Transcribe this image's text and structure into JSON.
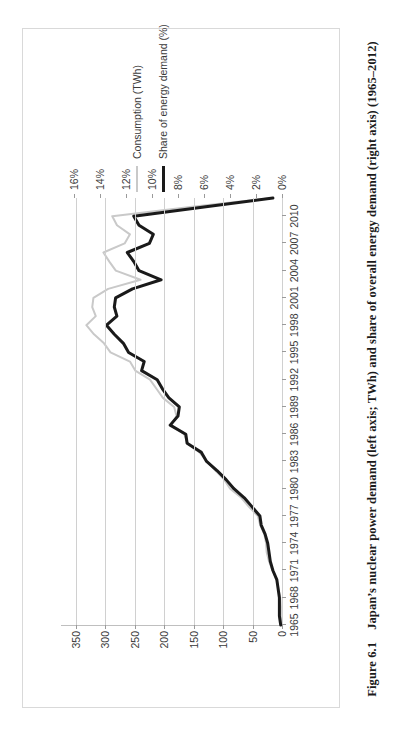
{
  "figure": {
    "number": "Figure 6.1",
    "caption": "Japan’s nuclear power demand (left axis; TWh) and share of overall energy demand (right axis) (1965–2012)"
  },
  "legend": {
    "position": "right",
    "items": [
      {
        "label": "Consumption (TWh)",
        "color": "#c9c9c9",
        "axis": "left"
      },
      {
        "label": "Share of energy demand (%)",
        "color": "#1a1a1a",
        "axis": "right"
      }
    ]
  },
  "chart_data": {
    "type": "line",
    "title": "",
    "subtitle": "",
    "xlabel": "",
    "ylabel": "",
    "grid": true,
    "rotation_deg": -90,
    "x": [
      1965,
      1966,
      1967,
      1968,
      1969,
      1970,
      1971,
      1972,
      1973,
      1974,
      1975,
      1976,
      1977,
      1978,
      1979,
      1980,
      1981,
      1982,
      1983,
      1984,
      1985,
      1986,
      1987,
      1988,
      1989,
      1990,
      1991,
      1992,
      1993,
      1994,
      1995,
      1996,
      1997,
      1998,
      1999,
      2000,
      2001,
      2002,
      2003,
      2004,
      2005,
      2006,
      2007,
      2008,
      2009,
      2010,
      2011,
      2012
    ],
    "xtick_labels": [
      "1965",
      "1968",
      "1971",
      "1974",
      "1977",
      "1980",
      "1983",
      "1986",
      "1989",
      "1992",
      "1995",
      "1998",
      "2001",
      "2004",
      "2007",
      "2010"
    ],
    "xtick_values": [
      1965,
      1968,
      1971,
      1974,
      1977,
      1980,
      1983,
      1986,
      1989,
      1992,
      1995,
      1998,
      2001,
      2004,
      2007,
      2010
    ],
    "left_axis": {
      "label": "Consumption (TWh)",
      "ticks": [
        0,
        50,
        100,
        150,
        200,
        250,
        300,
        350
      ],
      "tick_labels": [
        "0",
        "50",
        "100",
        "150",
        "200",
        "250",
        "300",
        "350"
      ],
      "ylim": [
        0,
        375
      ]
    },
    "right_axis": {
      "label": "Share of energy demand (%)",
      "ticks": [
        0,
        2,
        4,
        6,
        8,
        10,
        12,
        14,
        16
      ],
      "tick_labels": [
        "0%",
        "2%",
        "4%",
        "6%",
        "8%",
        "10%",
        "12%",
        "14%",
        "16%"
      ],
      "ylim": [
        0,
        17
      ]
    },
    "series": [
      {
        "name": "Consumption (TWh)",
        "axis": "left",
        "color": "#c9c9c9",
        "width": 2,
        "values": [
          1,
          2,
          2,
          3,
          6,
          9,
          16,
          22,
          26,
          27,
          30,
          37,
          41,
          56,
          69,
          88,
          98,
          113,
          127,
          140,
          160,
          166,
          188,
          179,
          183,
          202,
          213,
          224,
          249,
          258,
          291,
          302,
          319,
          332,
          316,
          322,
          320,
          295,
          240,
          282,
          293,
          303,
          267,
          258,
          280,
          288,
          156,
          17
        ]
      },
      {
        "name": "Share of energy demand (%)",
        "axis": "right",
        "color": "#1a1a1a",
        "width": 3,
        "values": [
          0.1,
          0.2,
          0.2,
          0.2,
          0.3,
          0.4,
          0.7,
          0.9,
          1.0,
          1.1,
          1.3,
          1.6,
          1.7,
          2.3,
          2.9,
          3.7,
          4.3,
          5.0,
          5.8,
          6.2,
          7.3,
          7.4,
          8.6,
          8.0,
          7.9,
          8.7,
          9.2,
          9.6,
          10.8,
          10.6,
          11.8,
          12.2,
          12.9,
          13.5,
          12.7,
          12.9,
          12.8,
          11.5,
          9.3,
          11.0,
          11.4,
          11.9,
          10.2,
          9.9,
          11.0,
          11.4,
          6.0,
          0.7
        ]
      }
    ]
  }
}
